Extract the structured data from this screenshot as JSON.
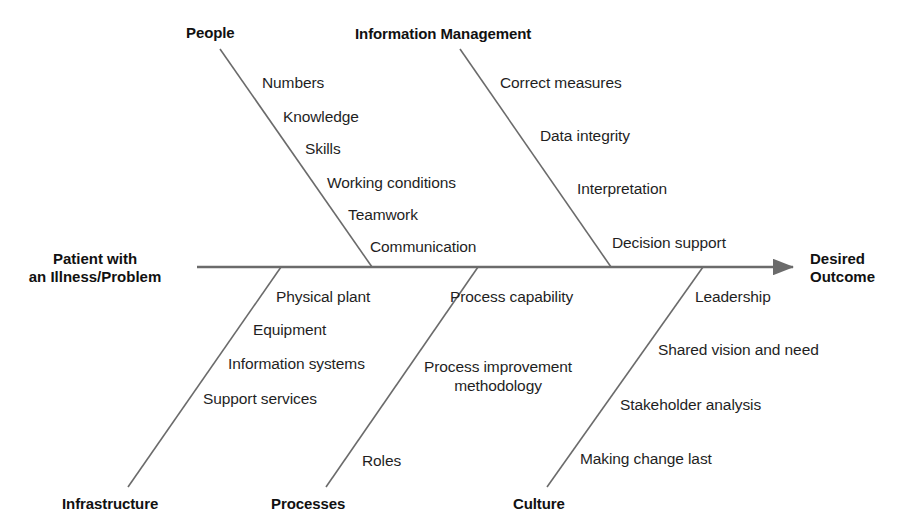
{
  "diagram": {
    "type": "fishbone-ishikawa",
    "effect_label_left": "Patient with\nan Illness/Problem",
    "effect_label_right": "Desired\nOutcome",
    "line_color": "#6b6b6b",
    "text_color": "#1f1f1f",
    "background": "#ffffff"
  },
  "categories": {
    "people": {
      "label": "People",
      "position": "top",
      "causes": [
        "Numbers",
        "Knowledge",
        "Skills",
        "Working conditions",
        "Teamwork",
        "Communication"
      ]
    },
    "information_management": {
      "label": "Information Management",
      "position": "top",
      "causes": [
        "Correct measures",
        "Data integrity",
        "Interpretation",
        "Decision support"
      ]
    },
    "infrastructure": {
      "label": "Infrastructure",
      "position": "bottom",
      "causes": [
        "Physical plant",
        "Equipment",
        "Information systems",
        "Support services"
      ]
    },
    "processes": {
      "label": "Processes",
      "position": "bottom",
      "causes": [
        "Process capability",
        "Process improvement\nmethodology",
        "Roles"
      ]
    },
    "culture": {
      "label": "Culture",
      "position": "bottom",
      "causes": [
        "Leadership",
        "Shared vision and need",
        "Stakeholder analysis",
        "Making change last"
      ]
    }
  }
}
